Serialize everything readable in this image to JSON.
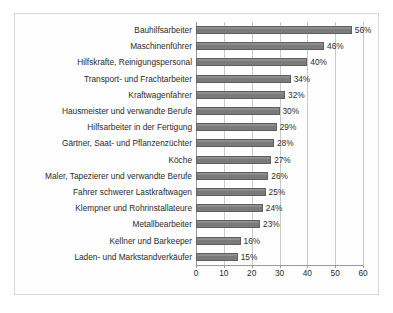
{
  "chart_data": {
    "type": "bar",
    "orientation": "horizontal",
    "title": "",
    "subtitle": "",
    "xlabel": "",
    "ylabel": "",
    "xlim": [
      0,
      60
    ],
    "xticks": [
      0,
      10,
      20,
      30,
      40,
      50,
      60
    ],
    "grid": true,
    "legend": null,
    "value_suffix": "%",
    "categories": [
      "Bauhilfsarbeiter",
      "Maschinenführer",
      "Hilfskrafte, Reinigungspersonal",
      "Transport- und Frachtarbeiter",
      "Kraftwagenfahrer",
      "Hausmeister und verwandte Berufe",
      "Hilfsarbeiter in der Fertigung",
      "Gärtner, Saat- und Pflanzenzüchter",
      "Köche",
      "Maler, Tapezierer und verwandte Berufe",
      "Fahrer schwerer Lastkraftwagen",
      "Klempner und Rohrinstallateure",
      "Metallbearbeiter",
      "Kellner und Barkeeper",
      "Laden- und Markstandverkäufer"
    ],
    "values": [
      56,
      46,
      40,
      34,
      32,
      30,
      29,
      28,
      27,
      26,
      25,
      24,
      23,
      16,
      15
    ],
    "value_labels": [
      "56%",
      "46%",
      "40%",
      "34%",
      "32%",
      "30%",
      "29%",
      "28%",
      "27%",
      "26%",
      "25%",
      "24%",
      "23%",
      "16%",
      "15%"
    ],
    "tick_labels": [
      "0",
      "10",
      "20",
      "30",
      "40",
      "50",
      "60"
    ],
    "colors": {
      "bar_fill": "#808080",
      "bar_edge": "#5f5f5f",
      "gridline": "#c9c9c9",
      "axis": "#9a9a9a",
      "text": "#2b2b2b",
      "plot_background": "#fefefe",
      "frame": "#d6d6d6"
    }
  }
}
